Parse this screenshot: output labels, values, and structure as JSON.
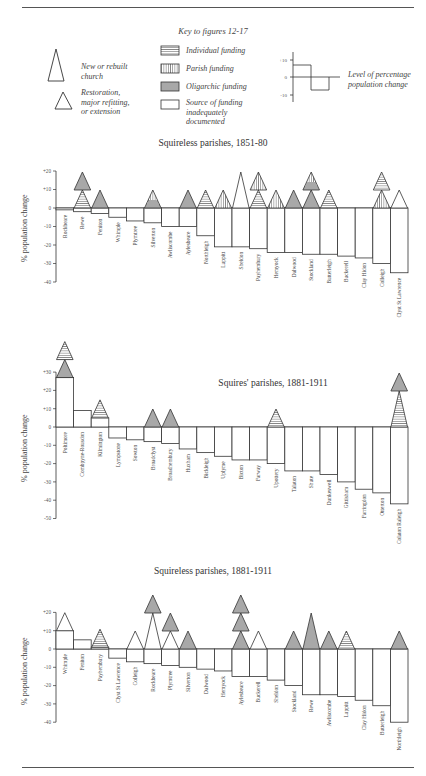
{
  "key": {
    "title": "Key to figures 12-17",
    "church_types": [
      {
        "label": "New or rebuilt church",
        "lines": [
          "New or rebuilt",
          "church"
        ],
        "icon": "tall-triangle-icon"
      },
      {
        "label": "Restoration, major refitting, or extension",
        "lines": [
          "Restoration,",
          "major refitting,",
          "or extension"
        ],
        "icon": "small-triangle-icon"
      }
    ],
    "funding_types": [
      {
        "label": "Individual funding",
        "pattern": "horizontal"
      },
      {
        "label": "Parish funding",
        "pattern": "vertical"
      },
      {
        "label": "Oligarchic funding",
        "pattern": "gray"
      },
      {
        "label": "Source of funding inadequately documented",
        "lines": [
          "Source of funding",
          "inadequately",
          "documented"
        ],
        "pattern": "empty"
      }
    ],
    "level_example": {
      "ticks": [
        "+10",
        "0",
        "-10"
      ],
      "lines": [
        "Level of percentage",
        "population change"
      ]
    }
  },
  "colors": {
    "gray_fill": "#a8a8a8",
    "line": "#333333",
    "rule": "#555555"
  },
  "chart_data": [
    {
      "type": "bar",
      "title": "Squireless parishes, 1851-80",
      "ylabel": "% population change",
      "yticks": [
        "+20",
        "+10",
        "0",
        "-10",
        "-20",
        "-30",
        "-40"
      ],
      "ylim": [
        -40,
        20
      ],
      "categories": [
        "Rockbeare",
        "Rewe",
        "Feniton",
        "Whimple",
        "Plymtree",
        "Silverton",
        "Awliscombe",
        "Aylesbeare",
        "Northleigh",
        "Luppitt",
        "Sheldon",
        "Payhembury",
        "Hemyock",
        "Dalwood",
        "Stockland",
        "Butterleigh",
        "Buckerell",
        "Clay Hidon",
        "Colleigh",
        "Clyst St Lawrence"
      ],
      "values": [
        -1,
        -2,
        -3,
        -5,
        -7,
        -8,
        -10,
        -10,
        -15,
        -21,
        -21,
        -22,
        -24,
        -24,
        -25,
        -25,
        -26,
        -27,
        -30,
        -35
      ],
      "churches": [
        [],
        [
          {
            "size": "small",
            "fill": "horizontal"
          },
          {
            "size": "small",
            "fill": "gray"
          }
        ],
        [
          {
            "size": "small",
            "fill": "gray"
          }
        ],
        [],
        [],
        [
          {
            "size": "small",
            "fill": "vertical-over-gray"
          }
        ],
        [],
        [
          {
            "size": "small",
            "fill": "gray"
          }
        ],
        [
          {
            "size": "small",
            "fill": "horizontal"
          }
        ],
        [
          {
            "size": "small",
            "fill": "vertical"
          }
        ],
        [
          {
            "size": "tall",
            "fill": "empty"
          }
        ],
        [
          {
            "size": "small",
            "fill": "horizontal"
          },
          {
            "size": "small",
            "fill": "vertical"
          }
        ],
        [
          {
            "size": "small",
            "fill": "vertical"
          }
        ],
        [
          {
            "size": "small",
            "fill": "gray"
          }
        ],
        [
          {
            "size": "small",
            "fill": "gray"
          },
          {
            "size": "small",
            "fill": "vertical-over-gray"
          }
        ],
        [
          {
            "size": "small",
            "fill": "horizontal"
          }
        ],
        [],
        [],
        [
          {
            "size": "small",
            "fill": "vertical"
          },
          {
            "size": "small",
            "fill": "horizontal"
          }
        ],
        [
          {
            "size": "small",
            "fill": "empty"
          }
        ]
      ]
    },
    {
      "type": "bar",
      "title": "Squires' parishes, 1881-1911",
      "ylabel": "% population change",
      "yticks": [
        "+30",
        "+20",
        "+10",
        "0",
        "-10",
        "-20",
        "-30",
        "-40",
        "-50"
      ],
      "ylim": [
        -50,
        30
      ],
      "categories": [
        "Poltimore",
        "Combpyne-Rousdon",
        "Kilmington",
        "Lympstone",
        "Sowton",
        "Broadclyst",
        "Broadhembury",
        "Huxham",
        "Bickleigh",
        "Uplyme",
        "Bicton",
        "Farway",
        "Upottery",
        "Talaton",
        "Shute",
        "Dunkeswell",
        "Gittisham",
        "Farringdon",
        "Otterton",
        "Colaton Raleigh"
      ],
      "values": [
        27,
        9,
        5,
        -6,
        -7,
        -8,
        -9,
        -12,
        -14,
        -16,
        -18,
        -18,
        -20,
        -24,
        -24,
        -26,
        -30,
        -34,
        -36,
        -42
      ],
      "churches": [
        [
          {
            "size": "small",
            "fill": "gray"
          },
          {
            "size": "small",
            "fill": "horizontal"
          }
        ],
        [],
        [
          {
            "size": "small",
            "fill": "horizontal"
          }
        ],
        [],
        [],
        [
          {
            "size": "small",
            "fill": "gray"
          }
        ],
        [
          {
            "size": "small",
            "fill": "gray"
          }
        ],
        [],
        [],
        [],
        [],
        [],
        [
          {
            "size": "small",
            "fill": "horizontal"
          }
        ],
        [],
        [],
        [],
        [],
        [],
        [],
        [
          {
            "size": "tall",
            "fill": "horizontal"
          },
          {
            "size": "small",
            "fill": "gray"
          }
        ]
      ]
    },
    {
      "type": "bar",
      "title": "Squireless parishes, 1881-1911",
      "ylabel": "% population change",
      "yticks": [
        "+20",
        "+10",
        "0",
        "-10",
        "-20",
        "-30",
        "-40"
      ],
      "ylim": [
        -40,
        20
      ],
      "categories": [
        "Whimple",
        "Feniton",
        "Payhembury",
        "Clyst St Lawrence",
        "Colleigh",
        "Rockbeare",
        "Plymtree",
        "Silverton",
        "Dalwood",
        "Hemyock",
        "Aylesbeare",
        "Buckerell",
        "Sheldon",
        "Stockland",
        "Rewe",
        "Awliscombe",
        "Luppitt",
        "Clay Hidon",
        "Butterleigh",
        "Northleigh"
      ],
      "values": [
        10,
        5,
        1,
        -5,
        -7,
        -8,
        -9,
        -10,
        -11,
        -12,
        -15,
        -15,
        -17,
        -20,
        -25,
        -25,
        -26,
        -28,
        -31,
        -40
      ],
      "churches": [
        [
          {
            "size": "small",
            "fill": "empty"
          }
        ],
        [],
        [
          {
            "size": "small",
            "fill": "horizontal"
          }
        ],
        [],
        [
          {
            "size": "small",
            "fill": "empty"
          }
        ],
        [
          {
            "size": "tall",
            "fill": "empty"
          },
          {
            "size": "small",
            "fill": "gray"
          }
        ],
        [
          {
            "size": "small",
            "fill": "empty"
          },
          {
            "size": "small",
            "fill": "gray"
          }
        ],
        [
          {
            "size": "small",
            "fill": "gray"
          }
        ],
        [],
        [],
        [
          {
            "size": "small",
            "fill": "gray"
          },
          {
            "size": "small",
            "fill": "gray"
          },
          {
            "size": "small",
            "fill": "gray"
          }
        ],
        [
          {
            "size": "small",
            "fill": "empty"
          }
        ],
        [],
        [
          {
            "size": "small",
            "fill": "gray"
          }
        ],
        [
          {
            "size": "tall",
            "fill": "gray"
          }
        ],
        [
          {
            "size": "small",
            "fill": "gray"
          }
        ],
        [
          {
            "size": "small",
            "fill": "horizontal"
          }
        ],
        [],
        [],
        [
          {
            "size": "small",
            "fill": "gray"
          }
        ]
      ]
    }
  ]
}
